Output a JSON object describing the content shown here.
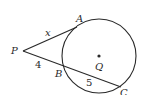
{
  "diagram": {
    "type": "geometry-tangent-secant",
    "circle": {
      "center_label": "Q",
      "cx": 99,
      "cy": 56,
      "r": 37
    },
    "points": {
      "P": {
        "label": "P",
        "x": 23,
        "y": 51
      },
      "A": {
        "label": "A",
        "x": 77,
        "y": 27
      },
      "B": {
        "label": "B",
        "x": 64,
        "y": 67
      },
      "C": {
        "label": "C",
        "x": 121,
        "y": 87
      }
    },
    "segments": [
      {
        "from": "P",
        "to": "A",
        "kind": "tangent",
        "length_label": "x"
      },
      {
        "from": "P",
        "to": "B",
        "kind": "secant-external",
        "length_label": "4"
      },
      {
        "from": "B",
        "to": "C",
        "kind": "chord",
        "length_label": "5"
      }
    ],
    "labels": {
      "P": "P",
      "A": "A",
      "B": "B",
      "C": "C",
      "Q": "Q",
      "x": "x",
      "four": "4",
      "five": "5"
    }
  }
}
